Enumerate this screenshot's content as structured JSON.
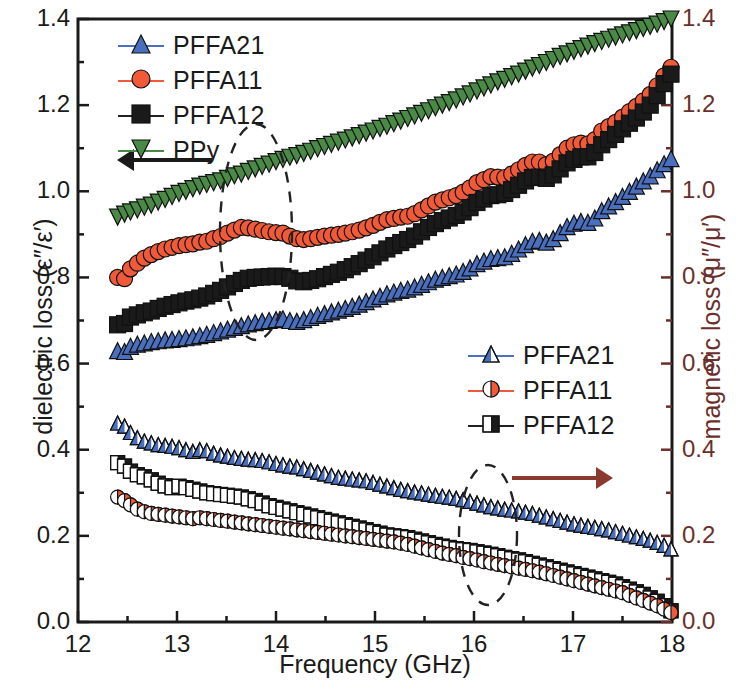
{
  "chart_data": {
    "type": "line",
    "title": "",
    "xlabel": "Frequency (GHz)",
    "ylabel": "dielectric loss (ε″/ε′)",
    "y2label": "magnetic loss (μ″/μ′)",
    "xlim": [
      12,
      18
    ],
    "ylim": [
      0.0,
      1.4
    ],
    "y2lim": [
      0.0,
      1.4
    ],
    "xticks": [
      12,
      13,
      14,
      15,
      16,
      17,
      18
    ],
    "xticklabels": [
      "12",
      "13",
      "14",
      "15",
      "16",
      "17",
      "18"
    ],
    "yticks": [
      0.0,
      0.2,
      0.4,
      0.6,
      0.8,
      1.0,
      1.2,
      1.4
    ],
    "yticklabels": [
      "0.0",
      "0.2",
      "0.4",
      "0.6",
      "0.8",
      "1.0",
      "1.2",
      "1.4"
    ],
    "y2ticks": [
      0.0,
      0.2,
      0.4,
      0.6,
      0.8,
      1.0,
      1.2,
      1.4
    ],
    "y2ticklabels": [
      "0.0",
      "0.2",
      "0.4",
      "0.6",
      "0.8",
      "1.0",
      "1.2",
      "1.4"
    ],
    "minor_ticks": true,
    "grid": false,
    "x": [
      12.4,
      12.47,
      12.53,
      12.6,
      12.67,
      12.74,
      12.81,
      12.88,
      12.95,
      13.02,
      13.09,
      13.16,
      13.23,
      13.3,
      13.37,
      13.44,
      13.51,
      13.58,
      13.65,
      13.72,
      13.79,
      13.86,
      13.93,
      14.0,
      14.07,
      14.14,
      14.21,
      14.28,
      14.35,
      14.42,
      14.49,
      14.56,
      14.63,
      14.7,
      14.77,
      14.84,
      14.91,
      14.98,
      15.05,
      15.12,
      15.19,
      15.26,
      15.33,
      15.4,
      15.47,
      15.54,
      15.61,
      15.68,
      15.75,
      15.82,
      15.89,
      15.96,
      16.03,
      16.1,
      16.17,
      16.24,
      16.31,
      16.38,
      16.45,
      16.52,
      16.59,
      16.66,
      16.73,
      16.8,
      16.87,
      16.94,
      17.01,
      17.08,
      17.15,
      17.22,
      17.29,
      17.36,
      17.43,
      17.5,
      17.57,
      17.64,
      17.71,
      17.78,
      17.85,
      17.92,
      17.99
    ],
    "series": [
      {
        "name": "PPy",
        "axis": "left",
        "color": "#4a8a46",
        "marker": "triangle-down",
        "values": [
          0.94,
          0.947,
          0.952,
          0.957,
          0.963,
          0.968,
          0.975,
          0.981,
          0.988,
          0.995,
          1.0,
          1.006,
          1.012,
          1.016,
          1.02,
          1.024,
          1.03,
          1.036,
          1.04,
          1.046,
          1.052,
          1.058,
          1.063,
          1.069,
          1.074,
          1.079,
          1.083,
          1.088,
          1.093,
          1.099,
          1.104,
          1.109,
          1.114,
          1.119,
          1.124,
          1.129,
          1.135,
          1.14,
          1.146,
          1.151,
          1.157,
          1.163,
          1.169,
          1.175,
          1.181,
          1.187,
          1.194,
          1.2,
          1.206,
          1.212,
          1.219,
          1.226,
          1.233,
          1.24,
          1.247,
          1.254,
          1.26,
          1.266,
          1.272,
          1.279,
          1.286,
          1.292,
          1.299,
          1.306,
          1.313,
          1.319,
          1.325,
          1.331,
          1.337,
          1.343,
          1.348,
          1.353,
          1.358,
          1.363,
          1.368,
          1.373,
          1.378,
          1.383,
          1.388,
          1.394,
          1.4
        ]
      },
      {
        "name": "PFFA11",
        "axis": "left",
        "color": "#f05a38",
        "marker": "circle",
        "values": [
          0.8,
          0.797,
          0.82,
          0.833,
          0.845,
          0.853,
          0.86,
          0.866,
          0.87,
          0.874,
          0.876,
          0.878,
          0.882,
          0.884,
          0.89,
          0.895,
          0.903,
          0.91,
          0.916,
          0.915,
          0.912,
          0.909,
          0.906,
          0.904,
          0.903,
          0.896,
          0.89,
          0.888,
          0.89,
          0.893,
          0.896,
          0.898,
          0.9,
          0.903,
          0.906,
          0.91,
          0.915,
          0.921,
          0.928,
          0.934,
          0.937,
          0.94,
          0.942,
          0.948,
          0.957,
          0.966,
          0.975,
          0.98,
          0.985,
          0.99,
          0.998,
          1.008,
          1.02,
          1.027,
          1.034,
          1.033,
          1.032,
          1.04,
          1.05,
          1.06,
          1.068,
          1.068,
          1.062,
          1.07,
          1.085,
          1.1,
          1.108,
          1.112,
          1.11,
          1.12,
          1.14,
          1.15,
          1.16,
          1.172,
          1.185,
          1.197,
          1.21,
          1.225,
          1.245,
          1.268,
          1.288
        ]
      },
      {
        "name": "PFFA12",
        "axis": "left",
        "color": "#1a1a1a",
        "marker": "square",
        "values": [
          0.69,
          0.693,
          0.708,
          0.713,
          0.718,
          0.722,
          0.728,
          0.733,
          0.737,
          0.741,
          0.745,
          0.748,
          0.752,
          0.757,
          0.763,
          0.77,
          0.778,
          0.786,
          0.793,
          0.798,
          0.8,
          0.801,
          0.802,
          0.803,
          0.802,
          0.798,
          0.792,
          0.79,
          0.793,
          0.797,
          0.802,
          0.807,
          0.812,
          0.818,
          0.825,
          0.832,
          0.84,
          0.848,
          0.857,
          0.866,
          0.874,
          0.881,
          0.888,
          0.896,
          0.906,
          0.916,
          0.925,
          0.932,
          0.938,
          0.944,
          0.952,
          0.962,
          0.974,
          0.982,
          0.99,
          0.992,
          0.995,
          1.004,
          1.014,
          1.024,
          1.032,
          1.033,
          1.03,
          1.038,
          1.052,
          1.066,
          1.074,
          1.08,
          1.08,
          1.09,
          1.108,
          1.12,
          1.132,
          1.145,
          1.158,
          1.17,
          1.184,
          1.2,
          1.222,
          1.25,
          1.272
        ]
      },
      {
        "name": "PFFA21",
        "axis": "left",
        "color": "#4a6fbe",
        "marker": "triangle-up",
        "values": [
          0.63,
          0.628,
          0.64,
          0.645,
          0.648,
          0.651,
          0.653,
          0.655,
          0.656,
          0.658,
          0.66,
          0.662,
          0.665,
          0.668,
          0.672,
          0.676,
          0.68,
          0.684,
          0.688,
          0.692,
          0.695,
          0.698,
          0.7,
          0.702,
          0.704,
          0.7,
          0.698,
          0.702,
          0.707,
          0.712,
          0.716,
          0.72,
          0.724,
          0.728,
          0.733,
          0.738,
          0.744,
          0.75,
          0.756,
          0.762,
          0.766,
          0.77,
          0.773,
          0.778,
          0.784,
          0.79,
          0.796,
          0.8,
          0.804,
          0.808,
          0.814,
          0.822,
          0.832,
          0.838,
          0.844,
          0.846,
          0.848,
          0.856,
          0.866,
          0.876,
          0.884,
          0.886,
          0.882,
          0.89,
          0.904,
          0.918,
          0.926,
          0.93,
          0.928,
          0.938,
          0.955,
          0.966,
          0.976,
          0.988,
          1.0,
          1.012,
          1.024,
          1.036,
          1.05,
          1.064,
          1.076
        ]
      },
      {
        "name": "PFFA21",
        "axis": "right",
        "color": "#4a6fbe",
        "marker": "triangle-up-half",
        "values": [
          0.462,
          0.455,
          0.44,
          0.428,
          0.42,
          0.416,
          0.412,
          0.41,
          0.408,
          0.405,
          0.4,
          0.396,
          0.4,
          0.398,
          0.392,
          0.388,
          0.385,
          0.382,
          0.38,
          0.378,
          0.377,
          0.375,
          0.372,
          0.368,
          0.365,
          0.362,
          0.36,
          0.356,
          0.352,
          0.348,
          0.344,
          0.34,
          0.336,
          0.334,
          0.332,
          0.33,
          0.328,
          0.324,
          0.32,
          0.316,
          0.312,
          0.308,
          0.305,
          0.302,
          0.3,
          0.297,
          0.294,
          0.292,
          0.29,
          0.287,
          0.284,
          0.28,
          0.276,
          0.272,
          0.268,
          0.265,
          0.262,
          0.26,
          0.258,
          0.255,
          0.252,
          0.248,
          0.244,
          0.24,
          0.236,
          0.232,
          0.228,
          0.225,
          0.222,
          0.22,
          0.217,
          0.214,
          0.21,
          0.206,
          0.202,
          0.198,
          0.194,
          0.19,
          0.185,
          0.178,
          0.17
        ]
      },
      {
        "name": "PFFA12",
        "axis": "right",
        "color": "#1a1a1a",
        "marker": "square-half",
        "values": [
          0.37,
          0.362,
          0.35,
          0.342,
          0.337,
          0.33,
          0.322,
          0.316,
          0.312,
          0.315,
          0.312,
          0.308,
          0.304,
          0.3,
          0.298,
          0.296,
          0.294,
          0.292,
          0.29,
          0.286,
          0.282,
          0.276,
          0.27,
          0.266,
          0.262,
          0.258,
          0.254,
          0.25,
          0.246,
          0.242,
          0.238,
          0.234,
          0.23,
          0.226,
          0.222,
          0.218,
          0.214,
          0.21,
          0.206,
          0.202,
          0.2,
          0.198,
          0.196,
          0.192,
          0.188,
          0.184,
          0.18,
          0.176,
          0.173,
          0.17,
          0.168,
          0.166,
          0.163,
          0.16,
          0.157,
          0.154,
          0.15,
          0.147,
          0.144,
          0.14,
          0.136,
          0.132,
          0.128,
          0.124,
          0.12,
          0.116,
          0.112,
          0.108,
          0.104,
          0.1,
          0.096,
          0.092,
          0.088,
          0.082,
          0.076,
          0.07,
          0.064,
          0.056,
          0.048,
          0.038,
          0.026
        ]
      },
      {
        "name": "PFFA11",
        "axis": "right",
        "color": "#f05a38",
        "marker": "circle-half",
        "values": [
          0.29,
          0.282,
          0.272,
          0.262,
          0.256,
          0.252,
          0.25,
          0.248,
          0.246,
          0.244,
          0.242,
          0.24,
          0.242,
          0.24,
          0.238,
          0.236,
          0.234,
          0.232,
          0.23,
          0.228,
          0.226,
          0.224,
          0.222,
          0.22,
          0.218,
          0.216,
          0.214,
          0.212,
          0.21,
          0.208,
          0.206,
          0.204,
          0.202,
          0.2,
          0.198,
          0.196,
          0.194,
          0.192,
          0.19,
          0.188,
          0.186,
          0.183,
          0.18,
          0.176,
          0.172,
          0.168,
          0.164,
          0.16,
          0.157,
          0.154,
          0.15,
          0.147,
          0.144,
          0.14,
          0.137,
          0.134,
          0.131,
          0.128,
          0.125,
          0.122,
          0.119,
          0.116,
          0.112,
          0.108,
          0.104,
          0.1,
          0.096,
          0.092,
          0.088,
          0.084,
          0.08,
          0.076,
          0.072,
          0.068,
          0.062,
          0.056,
          0.05,
          0.044,
          0.038,
          0.03,
          0.022
        ]
      }
    ],
    "annotations": [
      {
        "name": "left-arrow",
        "type": "arrow",
        "direction": "left",
        "color": "#1a1a1a"
      },
      {
        "name": "right-arrow",
        "type": "arrow",
        "direction": "right",
        "color": "#8a3a2e"
      },
      {
        "name": "upper-ellipse",
        "type": "dashed-ellipse"
      },
      {
        "name": "lower-ellipse",
        "type": "dashed-ellipse"
      }
    ]
  },
  "legend_left": {
    "items": [
      {
        "label": "PFFA21",
        "color": "#4a6fbe",
        "marker": "triangle-up"
      },
      {
        "label": "PFFA11",
        "color": "#f05a38",
        "marker": "circle"
      },
      {
        "label": "PFFA12",
        "color": "#1a1a1a",
        "marker": "square"
      },
      {
        "label": "PPy",
        "color": "#4a8a46",
        "marker": "triangle-down"
      }
    ]
  },
  "legend_right": {
    "items": [
      {
        "label": "PFFA21",
        "color": "#4a6fbe",
        "marker": "triangle-up-half"
      },
      {
        "label": "PFFA11",
        "color": "#f05a38",
        "marker": "circle-half"
      },
      {
        "label": "PFFA12",
        "color": "#1a1a1a",
        "marker": "square-half"
      }
    ]
  }
}
